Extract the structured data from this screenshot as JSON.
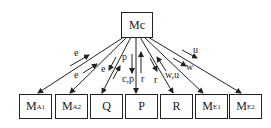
{
  "diagram": {
    "center_node": {
      "id": "Mc",
      "main": "M",
      "sub": "c"
    },
    "nodes": [
      {
        "id": "MA1",
        "main": "M",
        "sub": "A1"
      },
      {
        "id": "MA2",
        "main": "M",
        "sub": "A2"
      },
      {
        "id": "Q",
        "main": "Q",
        "sub": ""
      },
      {
        "id": "P",
        "main": "P",
        "sub": ""
      },
      {
        "id": "R",
        "main": "R",
        "sub": ""
      },
      {
        "id": "ME1",
        "main": "M",
        "sub": "E1"
      },
      {
        "id": "ME2",
        "main": "M",
        "sub": "E2"
      }
    ],
    "edge_labels": {
      "ma1": "e",
      "ma2": "e",
      "q_down": "e",
      "q_up": "p",
      "p_down": "c,p",
      "p_up": "r",
      "r_down": "r",
      "r_up": "w,u",
      "me1": "w",
      "me2": "u"
    },
    "colors": {
      "line": "#222222",
      "background": "#ffffff"
    }
  }
}
